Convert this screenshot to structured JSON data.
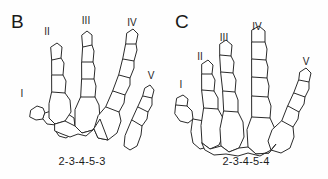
{
  "figure": {
    "background_color": "#fefefe",
    "line_color": "#2b2b2b",
    "text_color": "#1a1a1a"
  },
  "panels": [
    {
      "label": "B",
      "formula": "2-3-4-5-3",
      "digits": [
        {
          "label": "I",
          "x": 22,
          "y": 89
        },
        {
          "label": "II",
          "x": 47,
          "y": 27
        },
        {
          "label": "III",
          "x": 86,
          "y": 16
        },
        {
          "label": "IV",
          "x": 132,
          "y": 18
        },
        {
          "label": "V",
          "x": 151,
          "y": 71
        }
      ],
      "phalanx_counts": {
        "I": 2,
        "II": 3,
        "III": 4,
        "IV": 5,
        "V": 3
      }
    },
    {
      "label": "C",
      "formula": "2-3-4-5-4",
      "digits": [
        {
          "label": "I",
          "x": 17,
          "y": 80
        },
        {
          "label": "II",
          "x": 36,
          "y": 52
        },
        {
          "label": "III",
          "x": 60,
          "y": 33
        },
        {
          "label": "IV",
          "x": 93,
          "y": 22
        },
        {
          "label": "V",
          "x": 142,
          "y": 57
        }
      ],
      "phalanx_counts": {
        "I": 2,
        "II": 3,
        "III": 4,
        "IV": 5,
        "V": 4
      }
    }
  ]
}
